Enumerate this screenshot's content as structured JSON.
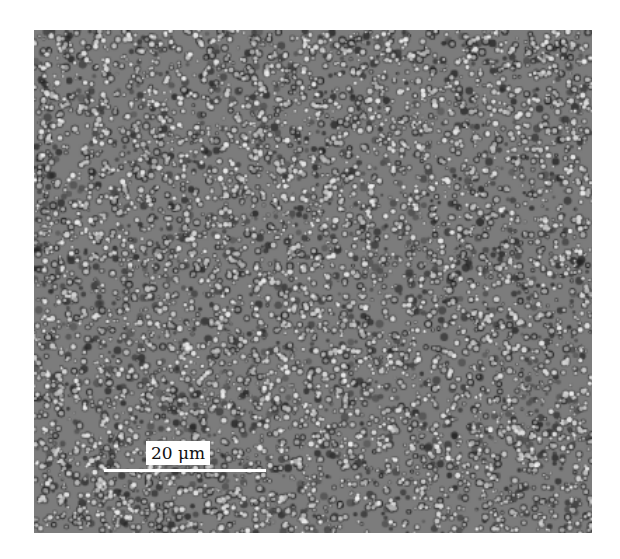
{
  "figure": {
    "scale_bar": {
      "label": "20 μm",
      "color": "#ffffff"
    },
    "colors": {
      "background": "#ffffff",
      "texture_mid": "#7a7a7a",
      "texture_dark": "#2a2a2a",
      "texture_light": "#e8e8e8"
    }
  }
}
